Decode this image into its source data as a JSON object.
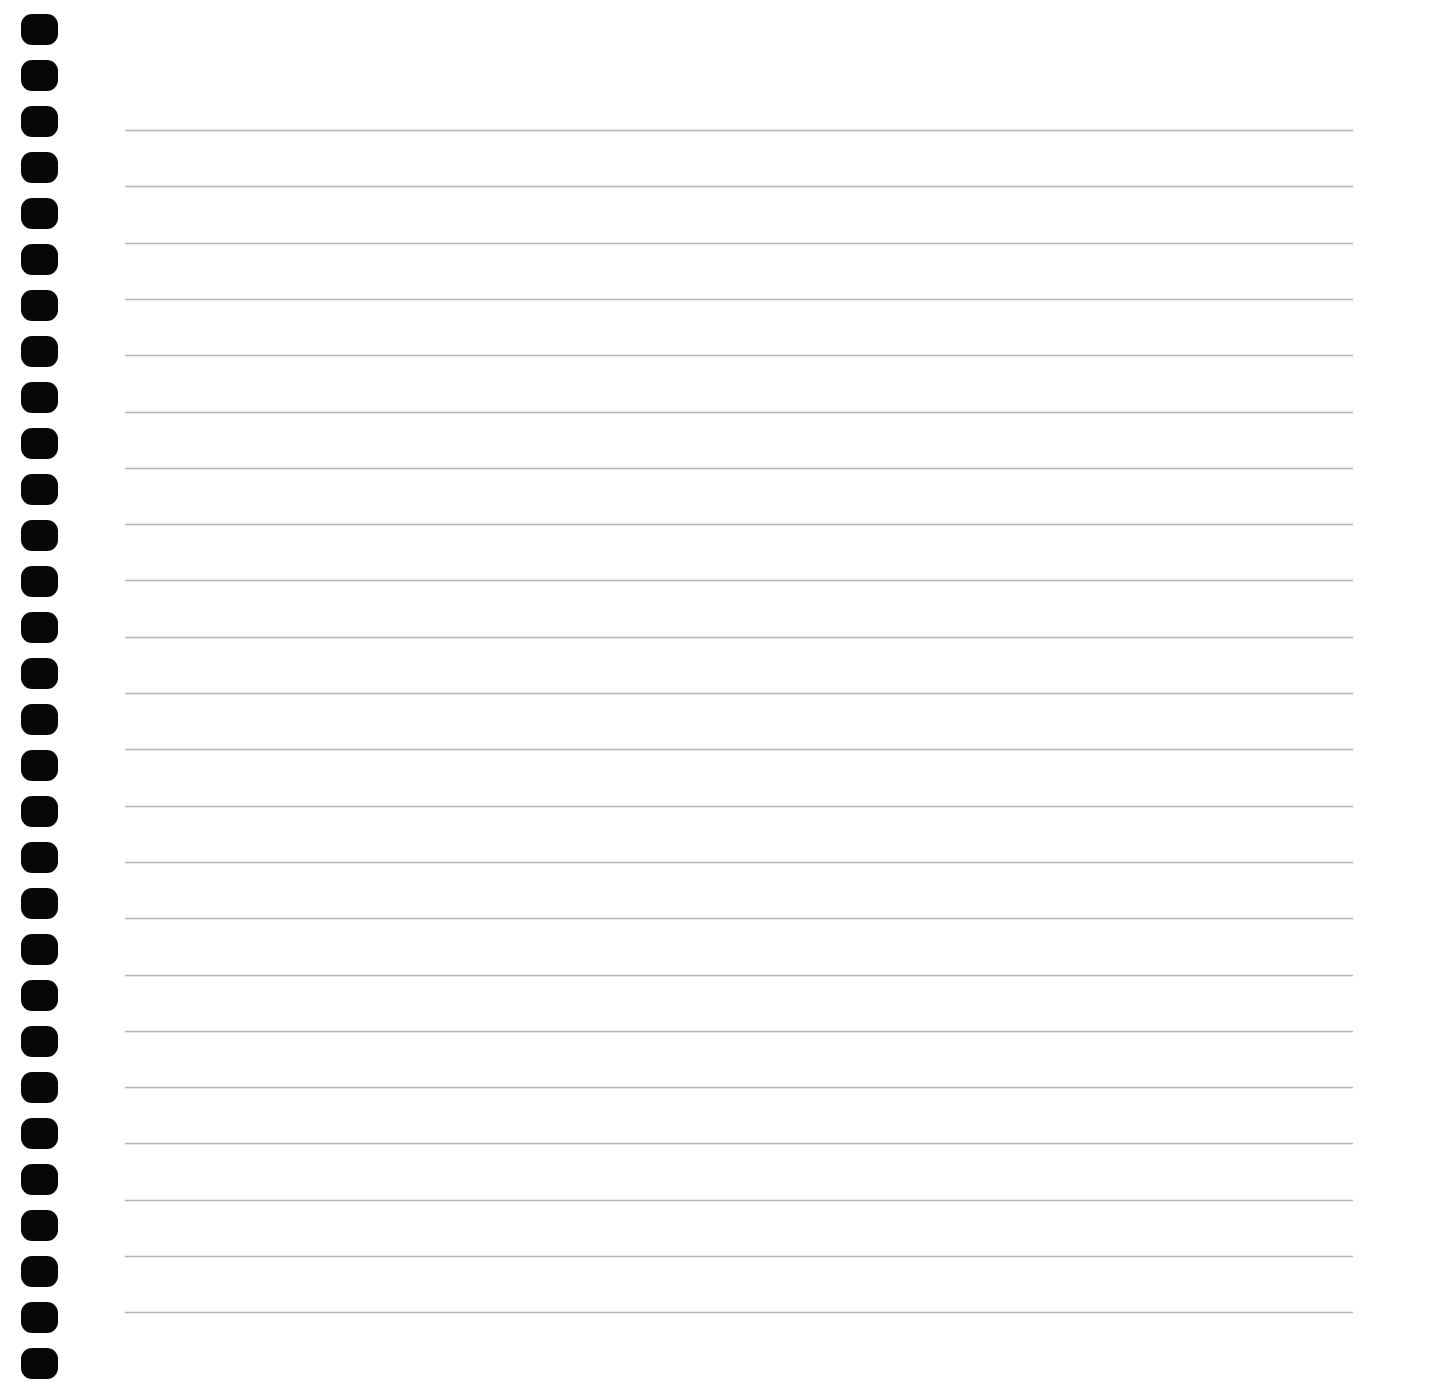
{
  "document": {
    "type": "scanned-notepad-page",
    "title": "Blank Lined Notepad Page",
    "page_text": "",
    "content_note": "No handwritten or printed text present on the page",
    "background_color": "#ffffff",
    "page_width": 1434,
    "page_height": 1389
  },
  "binding": {
    "name": "spiral-binding-holes",
    "side": "left",
    "hole_count": 30,
    "hole_color": "#070707",
    "hole_width": 37,
    "hole_height": 31,
    "hole_left": 21,
    "first_hole_top": 14,
    "hole_pitch": 46,
    "hole_corner_radius": 11
  },
  "ruling": {
    "name": "ruled-lines",
    "line_count": 22,
    "line_color": "#b4b6b8",
    "line_thickness": 1,
    "line_start_x": 125,
    "line_end_x": 1353,
    "first_line_y": 130,
    "line_pitch": 56.3
  },
  "margins": {
    "left_margin_label": "binding margin",
    "right_margin_label": "right blank margin",
    "right_margin_start_x": 1353,
    "top_margin_height": 130,
    "bottom_margin_start_y": 1302
  }
}
